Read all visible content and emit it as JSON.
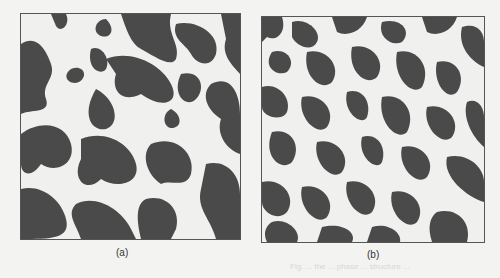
{
  "figure": {
    "panels": [
      {
        "id": "a",
        "label": "(a)",
        "description": "Binary two-phase microstructure with coarse connected dark domains on light background"
      },
      {
        "id": "b",
        "label": "(b)",
        "description": "Binary two-phase microstructure with finer, more fragmented dark domains on light background"
      }
    ],
    "colors": {
      "dark_phase": "#4a4a4a",
      "light_phase": "#f0f0ee",
      "border": "#555555"
    },
    "bleed_text": "Fig. ... the ... phase ... structure ..."
  }
}
